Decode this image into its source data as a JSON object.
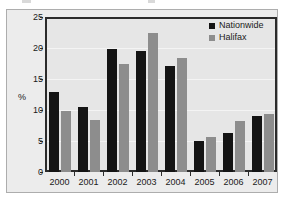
{
  "chart_data": {
    "type": "bar",
    "title": "",
    "xlabel": "",
    "ylabel": "%",
    "ylim": [
      0,
      25
    ],
    "yticks": [
      0,
      5,
      10,
      15,
      20,
      25
    ],
    "ytick_labels": [
      "0",
      "5",
      "10",
      "15",
      "20",
      "25"
    ],
    "grid": true,
    "legend_position": "top-right",
    "categories": [
      "2000",
      "2001",
      "2002",
      "2003",
      "2004",
      "2005",
      "2006",
      "2007"
    ],
    "series": [
      {
        "name": "Nationwide",
        "color": "#141414",
        "values": [
          12.9,
          10.5,
          19.8,
          19.5,
          17.1,
          5.0,
          6.3,
          9.1
        ]
      },
      {
        "name": "Halifax",
        "color": "#8d8d8d",
        "values": [
          9.8,
          8.4,
          17.4,
          22.5,
          18.4,
          5.6,
          8.2,
          9.4
        ]
      }
    ]
  },
  "legend": {
    "items": [
      {
        "label": "Nationwide",
        "swatch": "legend-swatch-nationwide"
      },
      {
        "label": "Halifax",
        "swatch": "legend-swatch-halifax"
      }
    ]
  },
  "axes": {
    "y_axis_title": "%"
  }
}
